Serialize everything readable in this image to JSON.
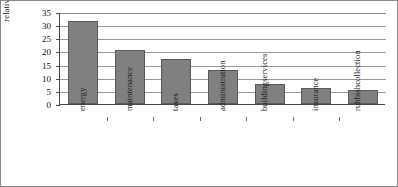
{
  "chart_data": {
    "type": "bar",
    "title": "",
    "subtitle": "",
    "xlabel": "",
    "ylabel": "relative costs [%]",
    "categories": [
      "energy",
      "maintenance",
      "taxes",
      "administration",
      "building services",
      "insurance",
      "rubbish collection"
    ],
    "category_lines": [
      [
        "energy"
      ],
      [
        "maintenance"
      ],
      [
        "taxes"
      ],
      [
        "administration"
      ],
      [
        "building",
        "services"
      ],
      [
        "insurance"
      ],
      [
        "rubbish",
        "collection"
      ]
    ],
    "values": [
      31.5,
      20.5,
      17,
      13,
      7.5,
      6,
      5.5
    ],
    "ylim": [
      0,
      35
    ],
    "ytick_labels": [
      "35",
      "30",
      "25",
      "20",
      "15",
      "10",
      "5",
      "0"
    ],
    "ytick_values": [
      35,
      30,
      25,
      20,
      15,
      10,
      5,
      0
    ],
    "grid": "horizontal",
    "legend": "none",
    "bar_color": "#808080",
    "bar_edge_color": "#5a5a5a",
    "axis_color": "#4a4a4a",
    "grid_color": "#9a9a9a",
    "background": "#ffffff"
  }
}
